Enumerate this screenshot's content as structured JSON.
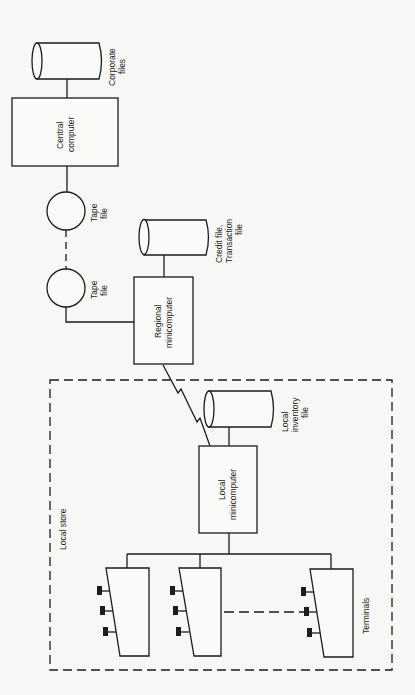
{
  "diagram": {
    "type": "system architecture (rotated 90°)",
    "nodes": {
      "corporate_files": {
        "label_line1": "Corporate",
        "label_line2": "files",
        "shape": "cylinder"
      },
      "central_computer": {
        "label_line1": "Central",
        "label_line2": "computer",
        "shape": "box"
      },
      "tape_file_1": {
        "label_line1": "Tape",
        "label_line2": "file",
        "shape": "circle"
      },
      "tape_file_2": {
        "label_line1": "Tape",
        "label_line2": "file",
        "shape": "circle"
      },
      "credit_file": {
        "label_line1": "Credit file,",
        "label_line2": "Transaction",
        "label_line3": "file",
        "shape": "cylinder"
      },
      "regional_minicomputer": {
        "label_line1": "Regional",
        "label_line2": "minicomputer",
        "shape": "box"
      },
      "local_store": {
        "label": "Local store",
        "shape": "dashed-boundary"
      },
      "local_inventory_file": {
        "label_line1": "Local",
        "label_line2": "inventory",
        "label_line3": "file",
        "shape": "cylinder"
      },
      "local_minicomputer": {
        "label_line1": "Local",
        "label_line2": "minicomputer",
        "shape": "box"
      },
      "terminals": {
        "label": "Terminals",
        "count_shown": 3,
        "shape": "terminal"
      }
    },
    "edges": [
      {
        "from": "corporate_files",
        "to": "central_computer",
        "style": "solid"
      },
      {
        "from": "central_computer",
        "to": "tape_file_1",
        "style": "solid"
      },
      {
        "from": "tape_file_1",
        "to": "tape_file_2",
        "style": "dashed"
      },
      {
        "from": "tape_file_2",
        "to": "regional_minicomputer",
        "style": "solid"
      },
      {
        "from": "credit_file",
        "to": "regional_minicomputer",
        "style": "solid"
      },
      {
        "from": "regional_minicomputer",
        "to": "local_minicomputer",
        "style": "zigzag (telecom link)"
      },
      {
        "from": "local_inventory_file",
        "to": "local_minicomputer",
        "style": "solid"
      },
      {
        "from": "local_minicomputer",
        "to": "terminals",
        "style": "solid bus"
      }
    ]
  }
}
